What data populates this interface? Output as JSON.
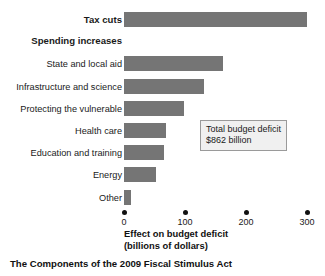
{
  "chart_data": {
    "type": "bar",
    "orientation": "horizontal",
    "title": "",
    "caption": "The Components of the 2009 Fiscal Stimulus Act",
    "xlabel": "Effect on budget deficit",
    "xlabel_line2": "(billions of dollars)",
    "ylabel": "",
    "xlim": [
      0,
      300
    ],
    "xticks": [
      0,
      100,
      200,
      300
    ],
    "xticklabels": [
      "0",
      "100",
      "200",
      "300"
    ],
    "grid": false,
    "legend": null,
    "bar_color": "#757575",
    "categories": [
      "Tax cuts",
      "State and local aid",
      "Infrastructure and science",
      "Protecting the vulnerable",
      "Health care",
      "Education and training",
      "Energy",
      "Other"
    ],
    "values": [
      300,
      162,
      131,
      98,
      69,
      65,
      53,
      12
    ],
    "group_heading": "Spending increases",
    "annotations": [
      {
        "line1": "Total budget deficit",
        "line2": "$862 billion"
      }
    ]
  },
  "rows": [
    {
      "label": "Tax cuts",
      "value": 300,
      "bold": true,
      "type": "bar"
    },
    {
      "label": "Spending increases",
      "value": null,
      "bold": true,
      "type": "heading"
    },
    {
      "label": "State and local aid",
      "value": 162,
      "bold": false,
      "type": "bar"
    },
    {
      "label": "Infrastructure and science",
      "value": 131,
      "bold": false,
      "type": "bar"
    },
    {
      "label": "Protecting the vulnerable",
      "value": 98,
      "bold": false,
      "type": "bar"
    },
    {
      "label": "Health care",
      "value": 69,
      "bold": false,
      "type": "bar"
    },
    {
      "label": "Education and training",
      "value": 65,
      "bold": false,
      "type": "bar"
    },
    {
      "label": "Energy",
      "value": 53,
      "bold": false,
      "type": "bar"
    },
    {
      "label": "Other",
      "value": 12,
      "bold": false,
      "type": "bar"
    }
  ],
  "axis": {
    "ticks": [
      "0",
      "100",
      "200",
      "300"
    ],
    "title_line1": "Effect on budget deficit",
    "title_line2": "(billions of dollars)"
  },
  "annotation": {
    "line1": "Total budget deficit",
    "line2": "$862 billion"
  },
  "caption": {
    "text": "The Components of the 2009 Fiscal Stimulus Act"
  },
  "colors": {
    "bar": "#757575",
    "background": "#ffffff",
    "annotation_bg": "#f0f0f0",
    "annotation_border": "#9a9a9a",
    "text": "#1a1a1a"
  }
}
